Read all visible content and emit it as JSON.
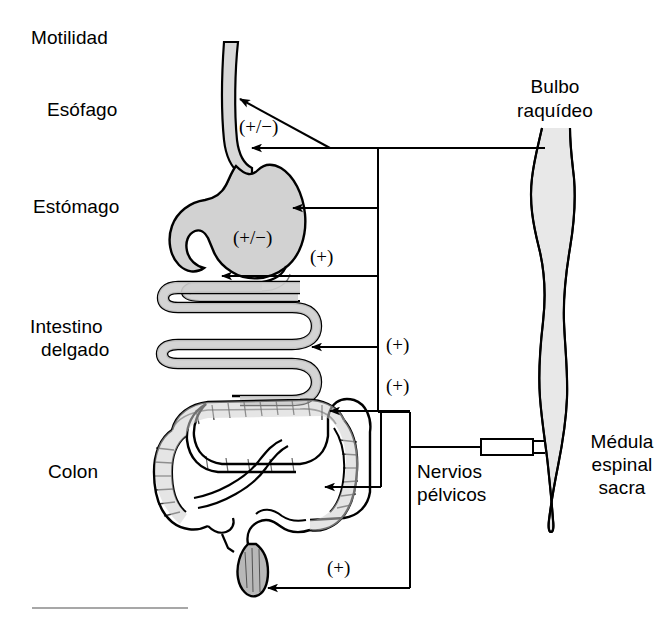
{
  "figure": {
    "width": 671,
    "height": 621,
    "background": "#ffffff",
    "line_color": "#000000",
    "organ_fill": "#d2d2d2",
    "organ_fill_light": "#e4e4e4",
    "cord_fill": "#e8e8e8"
  },
  "labels": {
    "motility": "Motilidad",
    "esophagus": "Esófago",
    "stomach": "Estómago",
    "small_intestine_line1": "Intestino",
    "small_intestine_line2": "delgado",
    "colon": "Colon",
    "medulla_line1": "Bulbo",
    "medulla_line2": "raquídeo",
    "pelvic_nerves_line1": "Nervios",
    "pelvic_nerves_line2": "pélvicos",
    "sacral_cord_line1": "Médula",
    "sacral_cord_line2": "espinal",
    "sacral_cord_line3": "sacra"
  },
  "signs": {
    "esophagus": "(+/−)",
    "stomach": "(+/−)",
    "duodenum": "(+)",
    "small_intestine": "(+)",
    "proximal_colon": "(+)",
    "distal_colon": "(+)",
    "rectum": "(+)"
  },
  "structures": {
    "esophagus": "esophagus-tube",
    "stomach": "stomach-body",
    "small_intestine": "small-intestine-coil",
    "colon": "colon-frame",
    "rectum": "rectum-segment",
    "spinal_cord": "spinal-cord",
    "ganglion": "pelvic-ganglion-box",
    "vagal_trunk": "vagal-nerve-trunk",
    "pelvic_trunk": "pelvic-nerve-trunk",
    "scale_rule": "bottom-scale-rule"
  }
}
